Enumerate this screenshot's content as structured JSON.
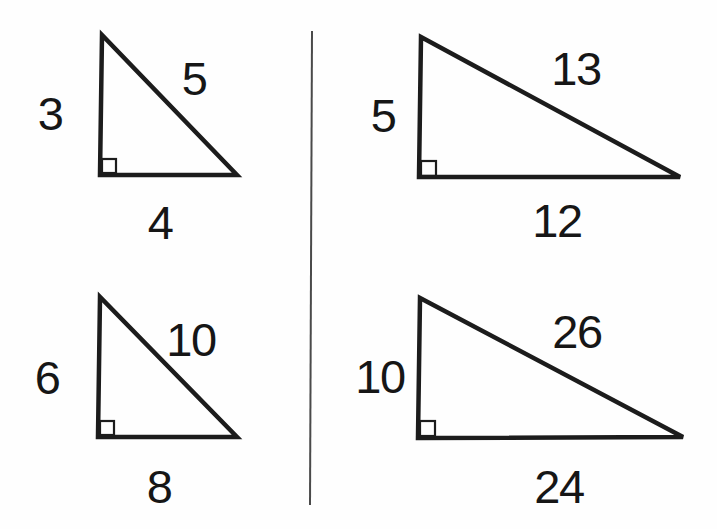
{
  "colors": {
    "background": "#fefefe",
    "stroke": "#1c1c1c",
    "divider": "#4a4a4a",
    "label": "#161616"
  },
  "triangles": [
    {
      "name": "3-4-5 right triangle",
      "left_leg": "3",
      "hypotenuse": "5",
      "base": "4"
    },
    {
      "name": "5-12-13 right triangle",
      "left_leg": "5",
      "hypotenuse": "13",
      "base": "12"
    },
    {
      "name": "6-8-10 right triangle",
      "left_leg": "6",
      "hypotenuse": "10",
      "base": "8"
    },
    {
      "name": "10-24-26 right triangle",
      "left_leg": "10",
      "hypotenuse": "26",
      "base": "24"
    }
  ]
}
